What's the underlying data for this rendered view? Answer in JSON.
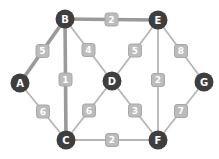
{
  "diagram": {
    "type": "weighted-undirected-graph",
    "background": "#ffffff",
    "node_style": {
      "fill": "#3e3e3e",
      "text_color": "#ffffff",
      "radius": 9.5
    },
    "edge_style": {
      "thin_color": "#b6b6b6",
      "thin_width": 1.8,
      "thick_color": "#9a9a9a",
      "thick_width": 3.6,
      "label_fill": "#bcbcbc",
      "label_border": "#a8a8a8",
      "label_text_color": "#ffffff",
      "label_size": 13
    },
    "nodes": [
      {
        "id": "A",
        "x": 20,
        "y": 83
      },
      {
        "id": "B",
        "x": 65,
        "y": 19
      },
      {
        "id": "C",
        "x": 66,
        "y": 140
      },
      {
        "id": "D",
        "x": 112,
        "y": 81
      },
      {
        "id": "E",
        "x": 158,
        "y": 20
      },
      {
        "id": "F",
        "x": 158,
        "y": 140
      },
      {
        "id": "G",
        "x": 204,
        "y": 82
      }
    ],
    "edges": [
      {
        "from": "A",
        "to": "B",
        "weight": 5,
        "emphasis": "thick"
      },
      {
        "from": "B",
        "to": "E",
        "weight": 2,
        "emphasis": "thick"
      },
      {
        "from": "B",
        "to": "C",
        "weight": 1,
        "emphasis": "thick"
      },
      {
        "from": "B",
        "to": "D",
        "weight": 4,
        "emphasis": "thin"
      },
      {
        "from": "D",
        "to": "E",
        "weight": 5,
        "emphasis": "thin"
      },
      {
        "from": "E",
        "to": "G",
        "weight": 8,
        "emphasis": "thin"
      },
      {
        "from": "E",
        "to": "F",
        "weight": 2,
        "emphasis": "thin"
      },
      {
        "from": "A",
        "to": "C",
        "weight": 6,
        "emphasis": "thin"
      },
      {
        "from": "C",
        "to": "D",
        "weight": 6,
        "emphasis": "thin"
      },
      {
        "from": "D",
        "to": "F",
        "weight": 3,
        "emphasis": "thin"
      },
      {
        "from": "F",
        "to": "G",
        "weight": 7,
        "emphasis": "thin"
      },
      {
        "from": "C",
        "to": "F",
        "weight": 2,
        "emphasis": "thin"
      }
    ]
  }
}
